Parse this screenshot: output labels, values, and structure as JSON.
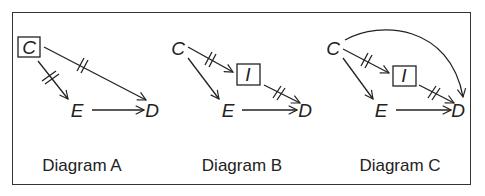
{
  "diagrams": [
    {
      "caption": "Diagram A",
      "nodes": {
        "C": "C",
        "E": "E",
        "D": "D"
      },
      "boxed": [
        "C"
      ],
      "edges": [
        {
          "from": "C",
          "to": "E",
          "blocked": true
        },
        {
          "from": "C",
          "to": "D",
          "blocked": true
        },
        {
          "from": "E",
          "to": "D",
          "blocked": false
        }
      ]
    },
    {
      "caption": "Diagram B",
      "nodes": {
        "C": "C",
        "I": "I",
        "E": "E",
        "D": "D"
      },
      "boxed": [
        "I"
      ],
      "edges": [
        {
          "from": "C",
          "to": "I",
          "blocked": true
        },
        {
          "from": "I",
          "to": "D",
          "blocked": true
        },
        {
          "from": "C",
          "to": "E",
          "blocked": false
        },
        {
          "from": "E",
          "to": "D",
          "blocked": false
        }
      ]
    },
    {
      "caption": "Diagram C",
      "nodes": {
        "C": "C",
        "I": "I",
        "E": "E",
        "D": "D"
      },
      "boxed": [
        "I"
      ],
      "edges": [
        {
          "from": "C",
          "to": "I",
          "blocked": true
        },
        {
          "from": "I",
          "to": "D",
          "blocked": true
        },
        {
          "from": "C",
          "to": "E",
          "blocked": false
        },
        {
          "from": "E",
          "to": "D",
          "blocked": false
        },
        {
          "from": "C",
          "to": "D",
          "blocked": false,
          "curved": true
        }
      ]
    }
  ]
}
